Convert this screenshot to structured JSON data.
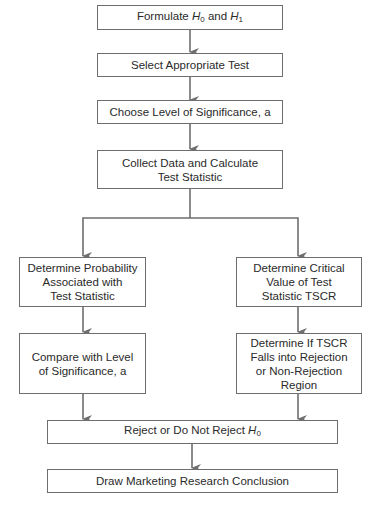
{
  "diagram": {
    "nodes": {
      "formulate": {
        "text_before": "Formulate ",
        "h0": "H",
        "h0_sub": "0",
        "mid": " and ",
        "h1": "H",
        "h1_sub": "1"
      },
      "select_test": {
        "text": "Select Appropriate Test"
      },
      "choose_level": {
        "text": "Choose Level of Significance, a"
      },
      "collect_data": {
        "line1": "Collect Data and Calculate",
        "line2": "Test Statistic"
      },
      "determine_probability": {
        "line1": "Determine Probability",
        "line2": "Associated with",
        "line3": "Test Statistic"
      },
      "compare_level": {
        "line1": "Compare with Level",
        "line2": "of Significance, a"
      },
      "determine_critical": {
        "line1": "Determine Critical",
        "line2": "Value of Test",
        "line3": "Statistic TSCR"
      },
      "determine_falls": {
        "line1": "Determine If TSCR",
        "line2": "Falls into Rejection",
        "line3": "or Non-Rejection",
        "line4": "Region"
      },
      "reject": {
        "text_before": "Reject or Do Not Reject ",
        "h0": "H",
        "h0_sub": "0"
      },
      "conclusion": {
        "text": "Draw Marketing Research Conclusion"
      }
    },
    "colors": {
      "line": "#6e6e6e",
      "text": "#2a2a2a",
      "background": "#ffffff"
    }
  }
}
